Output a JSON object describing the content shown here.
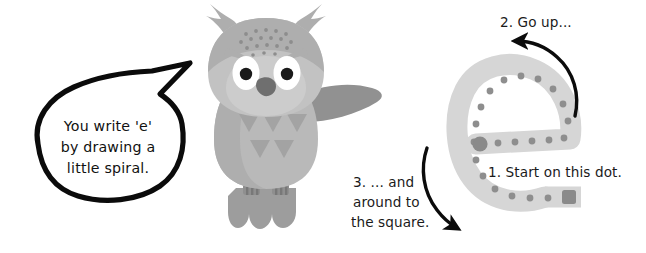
{
  "page": {
    "background": "#ffffff"
  },
  "speech_bubble": {
    "name": "owl speech bubble",
    "lines": [
      "You write 'e'",
      "by drawing a",
      "little spiral."
    ],
    "outline_color": "#000000",
    "fill_color": "#ffffff"
  },
  "owl": {
    "name": "owl mascot",
    "colors": {
      "body": "#b9b9b9",
      "body_shadow": "#a6a6a6",
      "head": "#c2c2c2",
      "head_top": "#aeaeae",
      "face": "#cccccc",
      "wing": "#919191",
      "tail": "#9d9d9d",
      "feet": "#8f8f8f",
      "eye_white": "#ffffff",
      "pupil": "#1a1a1a",
      "beak": "#6f6f6f",
      "chest_marks": "#a3a3a3",
      "speckles": "#9a9a9a"
    },
    "chest_triangles_top": 3,
    "chest_triangles_bottom": 2
  },
  "letter_trace": {
    "name": "letter e tracing guide",
    "letter": "e",
    "stroke_color": "#d6d6d6",
    "dot_color": "#8e8e8e",
    "start_dot_color": "#8a8a8a",
    "end_square_color": "#8a8a8a",
    "start_marker": "dot",
    "end_marker": "square",
    "dot_count": 21
  },
  "steps": [
    {
      "id": "step-1",
      "number": "1.",
      "text": "1. Start on this dot.",
      "lines": [
        "1. Start on this dot."
      ],
      "arrow": "none"
    },
    {
      "id": "step-2",
      "number": "2.",
      "text": "2. Go up...",
      "lines": [
        "2. Go up..."
      ],
      "arrow": "curved-arrow-left"
    },
    {
      "id": "step-3",
      "number": "3.",
      "text": "3. ... and around to the square.",
      "lines": [
        "3. ... and",
        "around to",
        "the square."
      ],
      "arrow": "curved-arrow-down-right"
    }
  ],
  "colors": {
    "ink": "#000000",
    "text": "#1a1a1a"
  }
}
